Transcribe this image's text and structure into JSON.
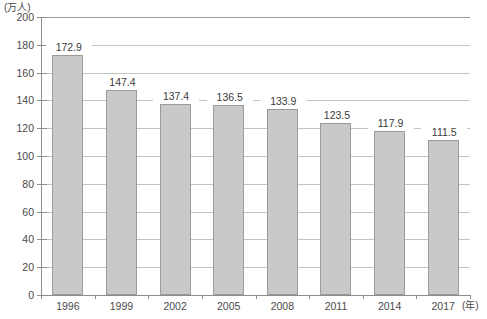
{
  "chart_data": {
    "type": "bar",
    "title": "",
    "subtitle": "",
    "xlabel": "(年)",
    "ylabel": "(万人)",
    "categories": [
      "1996",
      "1999",
      "2002",
      "2005",
      "2008",
      "2011",
      "2014",
      "2017"
    ],
    "values": [
      172.9,
      147.4,
      137.4,
      136.5,
      133.9,
      123.5,
      117.9,
      111.5
    ],
    "value_labels": [
      "172.9",
      "147.4",
      "137.4",
      "136.5",
      "133.9",
      "123.5",
      "117.9",
      "111.5"
    ],
    "series": [
      {
        "name": "",
        "values": [
          172.9,
          147.4,
          137.4,
          136.5,
          133.9,
          123.5,
          117.9,
          111.5
        ]
      }
    ],
    "ylim": [
      0,
      200
    ],
    "ytick_step": 20,
    "ytick_labels": [
      "200",
      "180",
      "160",
      "140",
      "120",
      "100",
      "80",
      "60",
      "40",
      "20",
      "0"
    ],
    "ytick_values": [
      200,
      180,
      160,
      140,
      120,
      100,
      80,
      60,
      40,
      20,
      0
    ],
    "grid": true,
    "grid_axis": "y",
    "legend": false,
    "legend_position": "none",
    "bar_color": "#c9c9c9",
    "bar_border_color": "#9b9b9b",
    "grid_color": "#c4c4c4",
    "axis_color": "#8d8d8d",
    "text_color": "#3b3b3b"
  },
  "axis": {
    "y_unit_label": "(万人)",
    "x_unit_label": "(年)"
  },
  "footer": {
    "source_note": ""
  }
}
